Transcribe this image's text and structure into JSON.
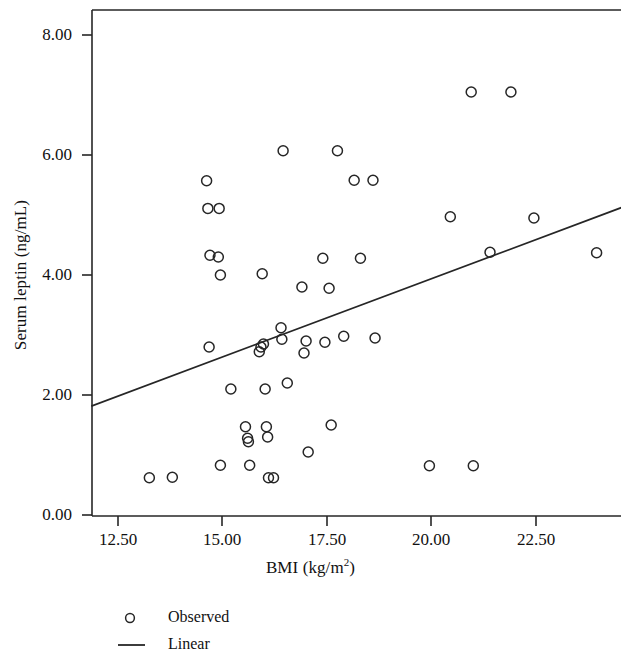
{
  "figure": {
    "background": "#ffffff",
    "ink_color": "#262626"
  },
  "chart_data": {
    "type": "scatter",
    "title": "",
    "xlabel": "BMI (kg/m²)",
    "xlabel_base": "BMI (kg/m",
    "xlabel_sup": "2",
    "xlabel_tail": ")",
    "ylabel": "Serum leptin (ng/mL)",
    "xlim": [
      11.6,
      24.8
    ],
    "ylim": [
      0.0,
      8.4
    ],
    "xticks": [
      12.5,
      15.0,
      17.5,
      20.0,
      22.5
    ],
    "xticklabels": [
      "12.50",
      "15.00",
      "17.50",
      "20.00",
      "22.50"
    ],
    "yticks": [
      0.0,
      2.0,
      4.0,
      6.0,
      8.0
    ],
    "yticklabels": [
      "0.00",
      "2.00",
      "4.00",
      "6.00",
      "8.00"
    ],
    "grid": false,
    "marker": "open-circle",
    "marker_size": 5,
    "legend": {
      "position": "below-axes-left",
      "entries": [
        {
          "label": "Observed",
          "type": "marker",
          "symbol": "open-circle"
        },
        {
          "label": "Linear",
          "type": "line"
        }
      ]
    },
    "series": [
      {
        "name": "Observed",
        "type": "scatter",
        "points": [
          [
            13.25,
            0.62
          ],
          [
            13.8,
            0.63
          ],
          [
            14.62,
            5.57
          ],
          [
            14.65,
            5.11
          ],
          [
            14.68,
            2.8
          ],
          [
            14.7,
            4.33
          ],
          [
            14.9,
            4.3
          ],
          [
            14.92,
            5.11
          ],
          [
            14.95,
            4.0
          ],
          [
            14.95,
            0.83
          ],
          [
            15.2,
            2.1
          ],
          [
            15.55,
            1.47
          ],
          [
            15.6,
            1.28
          ],
          [
            15.62,
            1.22
          ],
          [
            15.65,
            0.83
          ],
          [
            15.88,
            2.72
          ],
          [
            15.92,
            2.8
          ],
          [
            15.95,
            4.02
          ],
          [
            15.98,
            2.85
          ],
          [
            16.02,
            2.1
          ],
          [
            16.05,
            1.47
          ],
          [
            16.08,
            1.3
          ],
          [
            16.1,
            0.62
          ],
          [
            16.22,
            0.62
          ],
          [
            16.4,
            3.12
          ],
          [
            16.42,
            2.93
          ],
          [
            16.45,
            6.07
          ],
          [
            16.55,
            2.2
          ],
          [
            16.9,
            3.8
          ],
          [
            16.95,
            2.7
          ],
          [
            17.0,
            2.9
          ],
          [
            17.05,
            1.05
          ],
          [
            17.4,
            4.28
          ],
          [
            17.45,
            2.88
          ],
          [
            17.55,
            3.78
          ],
          [
            17.6,
            1.5
          ],
          [
            17.75,
            6.07
          ],
          [
            17.9,
            2.98
          ],
          [
            18.15,
            5.58
          ],
          [
            18.3,
            4.28
          ],
          [
            18.6,
            5.58
          ],
          [
            18.65,
            2.95
          ],
          [
            19.95,
            0.82
          ],
          [
            20.45,
            4.97
          ],
          [
            20.95,
            7.05
          ],
          [
            21.0,
            0.82
          ],
          [
            21.9,
            7.05
          ],
          [
            21.4,
            4.38
          ],
          [
            22.45,
            4.95
          ],
          [
            23.95,
            4.37
          ]
        ]
      },
      {
        "name": "Linear",
        "type": "line",
        "endpoints": [
          [
            11.88,
            1.82
          ],
          [
            24.53,
            5.12
          ]
        ],
        "slope": 0.261,
        "intercept": -1.28
      }
    ]
  }
}
